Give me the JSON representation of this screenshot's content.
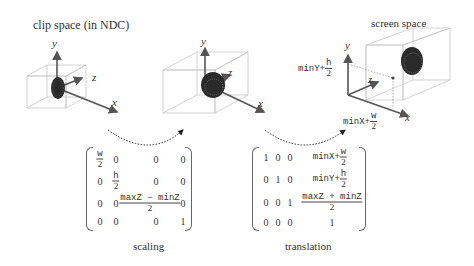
{
  "titles": {
    "clip_space": "clip space (in NDC)",
    "screen_space": "screen space"
  },
  "axes": {
    "x": "x",
    "y": "y",
    "z": "z"
  },
  "screen_labels": {
    "minY_prefix": "minY+",
    "minY_num": "h",
    "minY_den": "2",
    "minX_prefix": "minX+",
    "minX_num": "w",
    "minX_den": "2"
  },
  "scaling_matrix": {
    "caption": "scaling",
    "rows": [
      [
        {
          "num": "w",
          "den": "2"
        },
        "0",
        "0",
        "0"
      ],
      [
        "0",
        {
          "num": "h",
          "den": "2"
        },
        "0",
        "0"
      ],
      [
        "0",
        "0",
        {
          "num": "maxZ − minZ",
          "den": "2"
        },
        "0"
      ],
      [
        "0",
        "0",
        "0",
        "1"
      ]
    ]
  },
  "translation_matrix": {
    "caption": "translation",
    "rows": [
      [
        "1",
        "0",
        "0",
        {
          "prefix": "minX+",
          "num": "w",
          "den": "2"
        }
      ],
      [
        "0",
        "1",
        "0",
        {
          "prefix": "minY+",
          "num": "h",
          "den": "2"
        }
      ],
      [
        "0",
        "0",
        "1",
        {
          "num": "maxZ + minZ",
          "den": "2"
        }
      ],
      [
        "0",
        "0",
        "0",
        "1"
      ]
    ]
  },
  "colors": {
    "box": "#cccccc",
    "axis": "#555555",
    "object": "#333333",
    "arrow": "#333333"
  }
}
